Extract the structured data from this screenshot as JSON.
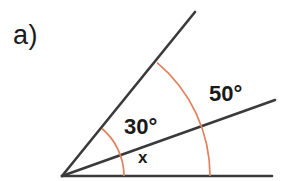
{
  "figure": {
    "part_label": "a)",
    "background_color": "#ffffff",
    "line_color": "#3a3a3a",
    "arc_color": "#e0815f",
    "text_color": "#1a1a1a"
  },
  "labels": {
    "angle_upper": "30°",
    "angle_outer": "50°",
    "angle_unknown": "x"
  },
  "geometry": {
    "vertex": {
      "x": 62,
      "y": 176
    },
    "rays": [
      {
        "name": "base-ray",
        "end_x": 272,
        "end_y": 176,
        "angle_deg": 0
      },
      {
        "name": "middle-ray",
        "end_x": 275,
        "end_y": 100,
        "angle_deg": 20
      },
      {
        "name": "steep-ray",
        "end_x": 195,
        "end_y": 12,
        "angle_deg": 50
      }
    ],
    "arcs": [
      {
        "name": "inner-arc",
        "radius": 62,
        "start_angle_deg": 0,
        "end_angle_deg": 50,
        "start_x": 124,
        "start_y": 176,
        "end_x": 102,
        "end_y": 128
      },
      {
        "name": "outer-arc",
        "radius": 148,
        "start_angle_deg": 0,
        "end_angle_deg": 50,
        "start_x": 210,
        "start_y": 176,
        "end_x": 157,
        "end_y": 63
      }
    ]
  }
}
